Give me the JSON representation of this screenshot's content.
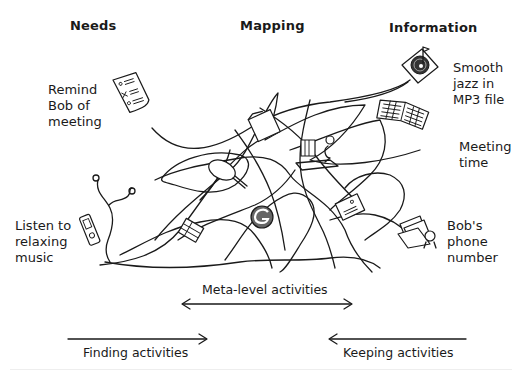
{
  "headers": {
    "needs": "Needs",
    "mapping": "Mapping",
    "information": "Information"
  },
  "needs_items": [
    {
      "label": "Remind\nBob of\nmeeting",
      "icon": "checklist-document-icon"
    },
    {
      "label": "Listen to\nrelaxing\nmusic",
      "icon": "mp3-player-icon"
    }
  ],
  "information_items": [
    {
      "label": "Smooth\njazz in\nMP3 file",
      "icon": "music-disc-icon"
    },
    {
      "label": "Meeting\ntime",
      "icon": "calendar-icon"
    },
    {
      "label": "Bob's\nphone\nnumber",
      "icon": "address-papers-icon"
    }
  ],
  "mapping_icons": [
    "folder-icon",
    "magnifier-icon",
    "person-at-desk-icon",
    "binders-icon",
    "search-engine-g-icon",
    "document-icon"
  ],
  "activities": {
    "meta": "Meta-level activities",
    "finding": "Finding activities",
    "keeping": "Keeping activities"
  },
  "colors": {
    "ink": "#1a1a1a",
    "background": "#ffffff"
  }
}
